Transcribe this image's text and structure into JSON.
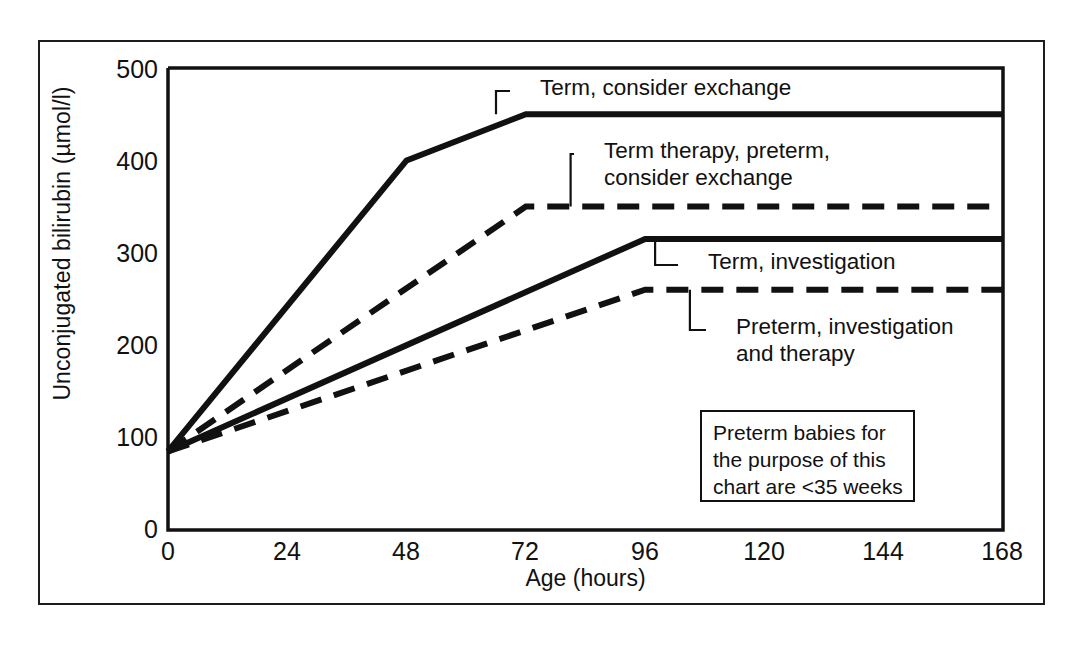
{
  "chart_data": {
    "type": "line",
    "title": "",
    "xlabel": "Age (hours)",
    "ylabel": "Unconjugated bilirubin (µmol/l)",
    "xlim": [
      0,
      168
    ],
    "ylim": [
      0,
      500
    ],
    "xticks": [
      "0",
      "24",
      "48",
      "72",
      "96",
      "120",
      "144",
      "168"
    ],
    "xtick_values": [
      0,
      24,
      48,
      72,
      96,
      120,
      144,
      168
    ],
    "yticks": [
      "0",
      "100",
      "200",
      "300",
      "400",
      "500"
    ],
    "ytick_values": [
      0,
      100,
      200,
      300,
      400,
      500
    ],
    "grid": false,
    "legend": "inline-annotations",
    "series": [
      {
        "name": "Term, consider exchange",
        "style": "solid",
        "color": "#111111",
        "x": [
          0,
          48,
          72,
          168
        ],
        "y": [
          85,
          400,
          450,
          450
        ]
      },
      {
        "name": "Term therapy, preterm, consider exchange",
        "style": "dashed",
        "color": "#111111",
        "x": [
          0,
          72,
          168
        ],
        "y": [
          85,
          350,
          350
        ]
      },
      {
        "name": "Term, investigation",
        "style": "solid",
        "color": "#111111",
        "x": [
          0,
          96,
          168
        ],
        "y": [
          85,
          315,
          315
        ]
      },
      {
        "name": "Preterm, investigation and therapy",
        "style": "dashed",
        "color": "#111111",
        "x": [
          0,
          96,
          168
        ],
        "y": [
          85,
          260,
          260
        ]
      }
    ],
    "annotations": [
      {
        "id": "ann-term-consider-exchange",
        "text": "Term, consider exchange",
        "anchor_x": 66,
        "anchor_y": 450,
        "label_x": 540,
        "label_y": 74
      },
      {
        "id": "ann-term-therapy-preterm",
        "text": "Term therapy, preterm,\nconsider exchange",
        "anchor_x": 81,
        "anchor_y": 350,
        "label_x": 604,
        "label_y": 137
      },
      {
        "id": "ann-term-investigation",
        "text": "Term, investigation",
        "anchor_x": 98,
        "anchor_y": 315,
        "label_x": 708,
        "label_y": 248
      },
      {
        "id": "ann-preterm-investigation",
        "text": "Preterm, investigation\nand therapy",
        "anchor_x": 105,
        "anchor_y": 260,
        "label_x": 736,
        "label_y": 313
      }
    ],
    "note_box": {
      "text": "Preterm babies for\nthe purpose of this\nchart are <35 weeks"
    }
  },
  "figure": {
    "frame_color": "#1c1c1c",
    "plot_bg": "#ffffff",
    "line_color": "#111111"
  }
}
